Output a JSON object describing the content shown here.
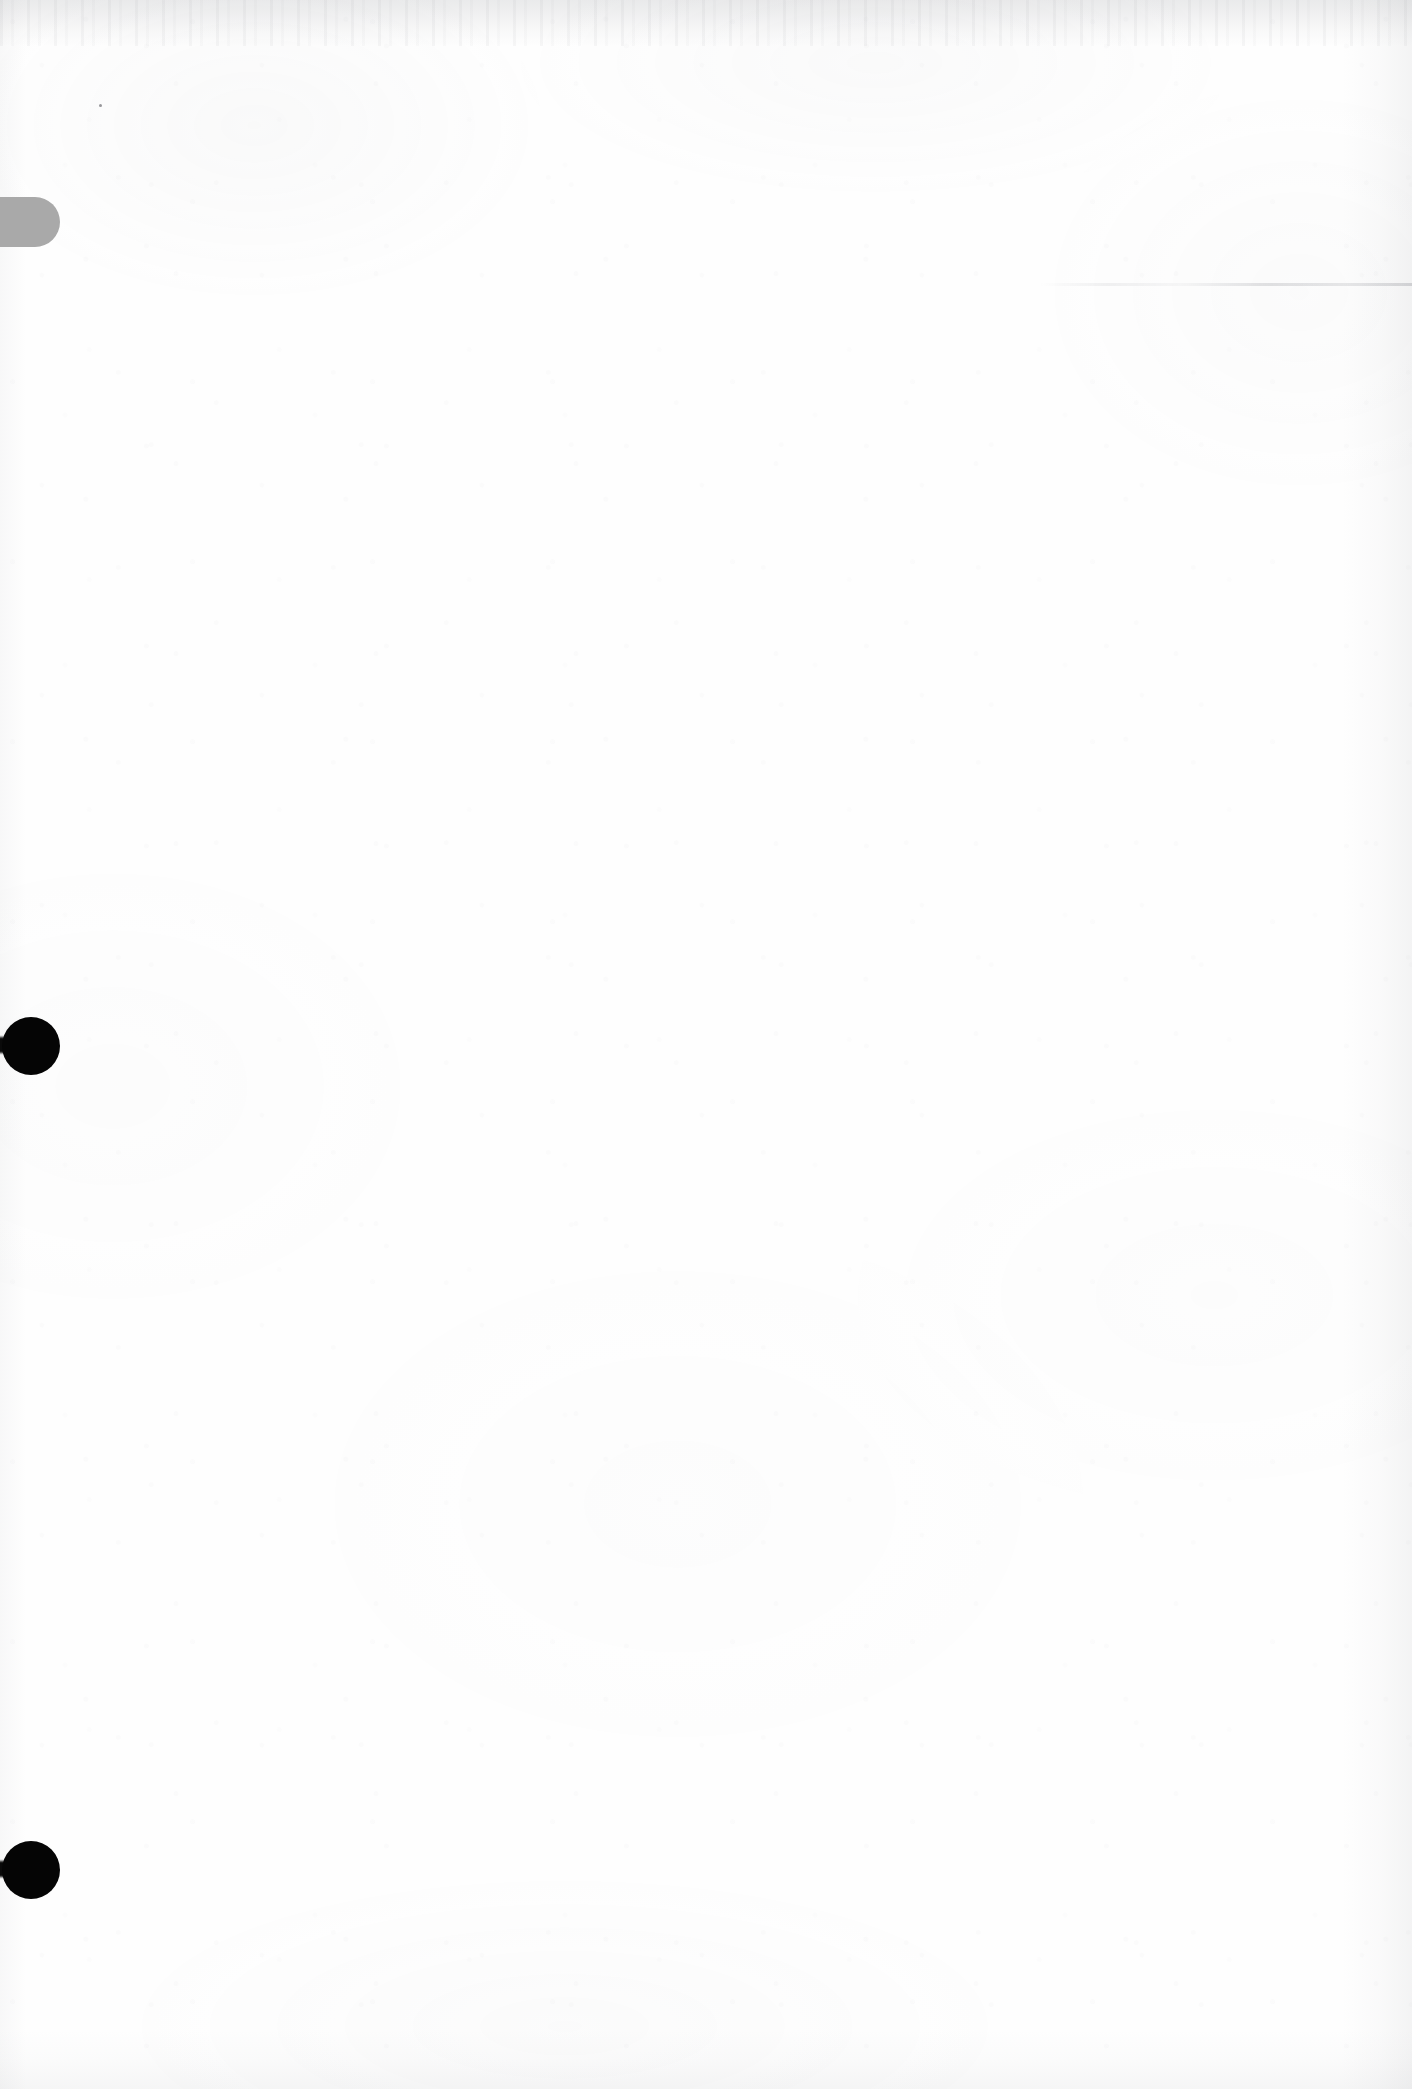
{
  "document": {
    "kind": "scanned-page",
    "page_state": "blank",
    "visible_text": "",
    "width_px": 1412,
    "height_px": 2089
  },
  "colors": {
    "paper": "#fefefe",
    "page_background": "#fdfdfd",
    "tab_mark_gray": "#a9a9a9",
    "dot_mark_black": "#050505",
    "edge_shadow": "#82848a"
  },
  "marks": {
    "tab": {
      "name": "gray-tab-mark",
      "shape": "rounded-tab",
      "color": "#a9a9a9",
      "x": 0,
      "y": 197,
      "width": 60,
      "height": 50
    },
    "dots": [
      {
        "name": "black-dot-upper",
        "shape": "circle",
        "color": "#050505",
        "center_x": 31,
        "center_y": 1046,
        "radius": 29
      },
      {
        "name": "black-dot-lower",
        "shape": "circle",
        "color": "#050505",
        "center_x": 31,
        "center_y": 1870,
        "radius": 29
      }
    ],
    "smudge": {
      "name": "faint-horizontal-smudge",
      "x": 1040,
      "y": 283,
      "width": 372,
      "height": 3
    },
    "speck": {
      "name": "ink-speck",
      "x": 99,
      "y": 104,
      "size": 3
    }
  },
  "texture": {
    "top_band_height": 46,
    "right_gutter_width": 70,
    "left_edge_width": 26,
    "bottom_edge_height": 60,
    "noise_opacity": "0.55",
    "mottle_opacity": "0.5"
  }
}
